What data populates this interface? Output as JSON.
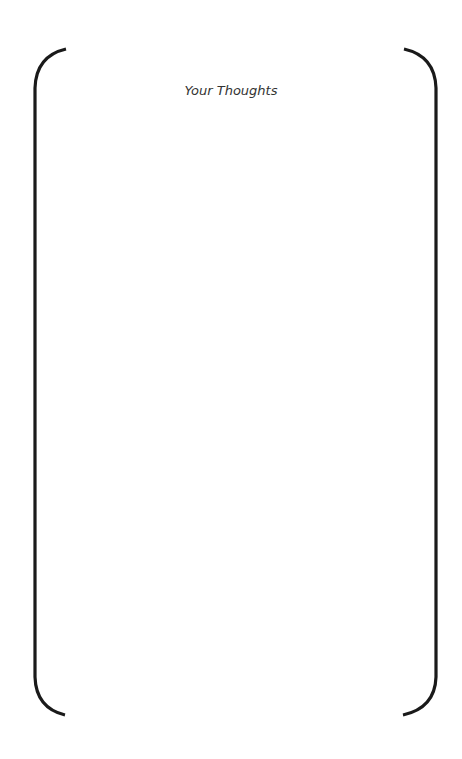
{
  "page": {
    "title": "Your Thoughts",
    "background_color": "#ffffff",
    "bracket_color": "#1a1a1a",
    "title_color": "#333333"
  }
}
